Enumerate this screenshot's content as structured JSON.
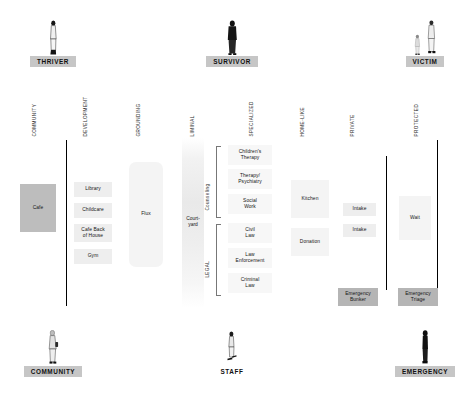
{
  "diagram": {
    "personas_top": [
      {
        "id": "thriver",
        "label": "THRIVER",
        "figures": 1,
        "boxed": true
      },
      {
        "id": "survivor",
        "label": "SURVIVOR",
        "figures": 1,
        "boxed": true
      },
      {
        "id": "victim",
        "label": "VICTIM",
        "figures": 2,
        "boxed": true
      }
    ],
    "personas_bottom": [
      {
        "id": "community",
        "label": "COMMUNITY",
        "figures": 1,
        "boxed": true
      },
      {
        "id": "staff",
        "label": "STAFF",
        "figures": 1,
        "boxed": false
      },
      {
        "id": "emergency",
        "label": "EMERGENCY",
        "figures": 1,
        "boxed": true
      }
    ],
    "column_headers": [
      {
        "id": "community",
        "label": "COMMUNITY"
      },
      {
        "id": "development",
        "label": "DEVELOPMENT"
      },
      {
        "id": "grounding",
        "label": "GROUNDING"
      },
      {
        "id": "liminal",
        "label": "LIMINAL"
      },
      {
        "id": "specialized",
        "label": "SPECIALIZED"
      },
      {
        "id": "home-like",
        "label": "HOME-LIKE"
      },
      {
        "id": "private",
        "label": "PRIVATE"
      },
      {
        "id": "protected",
        "label": "PROTECTED"
      }
    ],
    "blocks": [
      {
        "id": "cafe",
        "label": "Cafe"
      },
      {
        "id": "library",
        "label": "Library"
      },
      {
        "id": "childcare",
        "label": "Childcare"
      },
      {
        "id": "cafe-back-of-house",
        "label": "Cafe Back\nof House"
      },
      {
        "id": "gym",
        "label": "Gym"
      },
      {
        "id": "flux",
        "label": "Flux"
      },
      {
        "id": "courtyard",
        "label": "Court-\nyard"
      },
      {
        "id": "childrens-therapy",
        "label": "Children's\nTherapy"
      },
      {
        "id": "therapy-psychiatry",
        "label": "Therapy/\nPsychiatry"
      },
      {
        "id": "social-work",
        "label": "Social\nWork"
      },
      {
        "id": "civil-law",
        "label": "Civil\nLaw"
      },
      {
        "id": "law-enforcement",
        "label": "Law\nEnforcement"
      },
      {
        "id": "criminal-law",
        "label": "Criminal\nLaw"
      },
      {
        "id": "kitchen",
        "label": "Kitchen"
      },
      {
        "id": "donation",
        "label": "Donation"
      },
      {
        "id": "intake-1",
        "label": "Intake"
      },
      {
        "id": "intake-2",
        "label": "Intake"
      },
      {
        "id": "wait",
        "label": "Wait"
      },
      {
        "id": "emergency-bunker",
        "label": "Emergency\nBunker"
      },
      {
        "id": "emergency-triage",
        "label": "Emergency\nTriage"
      }
    ],
    "brackets": [
      {
        "id": "counseling",
        "label": "Counseling"
      },
      {
        "id": "legal",
        "label": "LEGAL"
      }
    ],
    "colors": {
      "background": "#ffffff",
      "persona_label_bg": "#c6c6c6",
      "block_light": "#eeeeee",
      "block_mid": "#bdbdbd",
      "divider": "#000000"
    }
  }
}
